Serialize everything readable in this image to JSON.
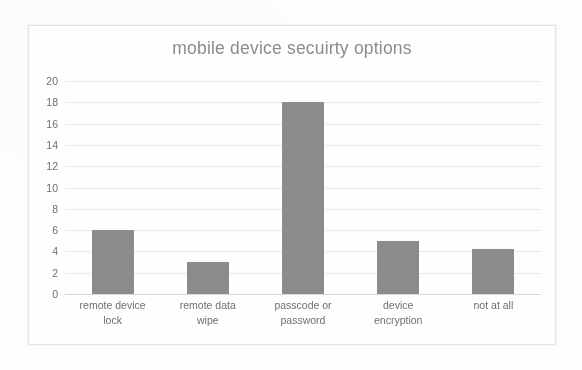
{
  "chart_data": {
    "type": "bar",
    "title": "mobile device secuirty options",
    "xlabel": "",
    "ylabel": "",
    "categories": [
      "remote device lock",
      "remote data wipe",
      "passcode or password",
      "device encryption",
      "not at all"
    ],
    "values": [
      6,
      3,
      18,
      5,
      4.2
    ],
    "ylim": [
      0,
      20
    ],
    "ytick_labels": [
      "20",
      "18",
      "16",
      "14",
      "12",
      "10",
      "8",
      "6",
      "4",
      "2",
      "0"
    ],
    "ytick_values": [
      20,
      18,
      16,
      14,
      12,
      10,
      8,
      6,
      4,
      2,
      0
    ],
    "grid": true,
    "legend": false,
    "bar_color": "#8b8b8b",
    "gridline_color": "#e9e9e9",
    "text_color": "#6f6f6f",
    "title_color": "#8c8c8c"
  },
  "chart": {
    "title": "mobile device secuirty options",
    "category_lines": [
      [
        "remote device",
        "lock"
      ],
      [
        "remote data",
        "wipe"
      ],
      [
        "passcode or",
        "password"
      ],
      [
        "device",
        "encryption"
      ],
      [
        "not at all",
        ""
      ]
    ]
  }
}
